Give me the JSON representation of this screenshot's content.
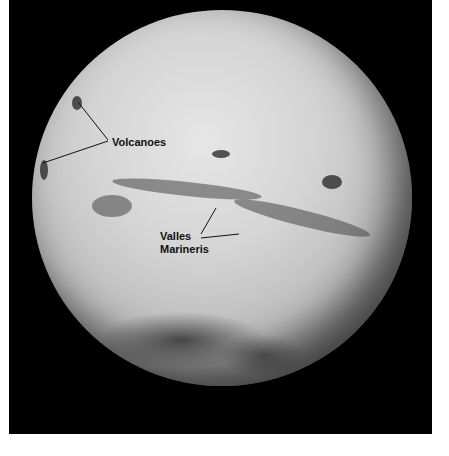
{
  "image": {
    "subject": "Mars globe",
    "background_color": "#000000",
    "margin_color": "#ffffff"
  },
  "labels": {
    "volcanoes": "Volcanoes",
    "valles_line1": "Valles",
    "valles_line2": "Marineris"
  }
}
